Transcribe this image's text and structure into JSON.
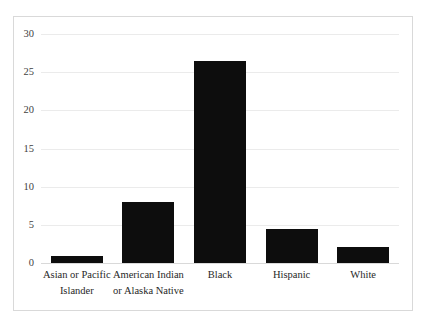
{
  "chart_data": {
    "type": "bar",
    "title": "",
    "subtitle": "",
    "xlabel": "",
    "ylabel": "",
    "categories": [
      "Asian or Pacific Islander",
      "American Indian or Alaska Native",
      "Black",
      "Hispanic",
      "White"
    ],
    "values": [
      0.9,
      8.0,
      26.4,
      4.5,
      2.1
    ],
    "ylim": [
      0,
      30
    ],
    "ytick_labels": [
      "0",
      "5",
      "10",
      "15",
      "20",
      "25",
      "30"
    ],
    "ytick_values": [
      0,
      5,
      10,
      15,
      20,
      25,
      30
    ],
    "grid": true,
    "legend": "none",
    "bar_color": "#0d0d0d",
    "gridline_color": "#ebebeb",
    "axis_color": "#d9d9d9",
    "background_color": "#ffffff"
  },
  "figure": {
    "border_color": "#d9d9d9"
  }
}
